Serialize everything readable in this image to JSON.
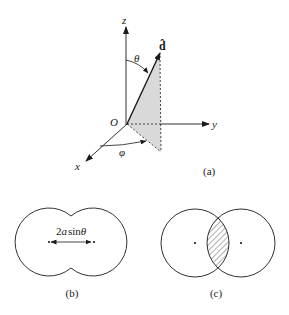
{
  "panel_a": {
    "caption": "(a)",
    "axes": {
      "z_label": "z",
      "y_label": "y",
      "x_label": "x",
      "origin_label": "O"
    },
    "vector_label": "d̂",
    "angle_polar_label": "θ",
    "angle_azimuth_label": "φ"
  },
  "panel_b": {
    "caption": "(b)",
    "dimension_label": "2a sin θ",
    "dimension_label_parts": {
      "coef": "2",
      "var": "a",
      "func": "sin",
      "angle": "θ"
    }
  },
  "panel_c": {
    "caption": "(c)"
  },
  "colors": {
    "stroke": "#1a1a1a",
    "shade": "#d9d9d9",
    "background": "#ffffff"
  }
}
